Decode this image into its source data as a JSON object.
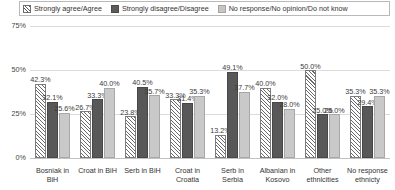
{
  "legend": {
    "position": "top",
    "items": [
      {
        "label": "Strongly agree/Agree",
        "swatch": "hatched-diagonal-swatch",
        "color": "#ffffff"
      },
      {
        "label": "Strongly disagree/Disagree",
        "swatch": "solid-dark-swatch",
        "color": "#585858"
      },
      {
        "label": "No response/No opinion/Do not know",
        "swatch": "solid-light-swatch",
        "color": "#c9c9c9"
      }
    ]
  },
  "axis": {
    "yticks": [
      "0%",
      "25%",
      "50%",
      "75%"
    ]
  },
  "chart_data": {
    "type": "bar",
    "title": "",
    "xlabel": "",
    "ylabel": "",
    "ylim": [
      0,
      75
    ],
    "grid": true,
    "legend_position": "top",
    "categories": [
      "Bosniak in BiH",
      "Croat in BiH",
      "Serb in BiH",
      "Croat in Croatia",
      "Serb in Serbia",
      "Albanian in Kosovo",
      "Other ethnicities",
      "No response ethnicty"
    ],
    "ytick_labels": [
      "0%",
      "25%",
      "50%",
      "75%"
    ],
    "ytick_values": [
      0,
      25,
      50,
      75
    ],
    "series": [
      {
        "name": "Strongly agree/Agree",
        "values": [
          42.3,
          26.7,
          23.8,
          33.3,
          13.2,
          40.0,
          50.0,
          35.3
        ],
        "labels": [
          "42.3%",
          "26.7%",
          "23.8%",
          "33.3%",
          "13.2%",
          "40.0%",
          "50.0%",
          "35.3%"
        ]
      },
      {
        "name": "Strongly disagree/Disagree",
        "values": [
          32.1,
          33.3,
          40.5,
          31.4,
          49.1,
          32.0,
          25.0,
          29.4
        ],
        "labels": [
          "32.1%",
          "33.3%",
          "40.5%",
          "31.4%",
          "49.1%",
          "32.0%",
          "25.0%",
          "29.4%"
        ]
      },
      {
        "name": "No response/No opinion/Do not know",
        "values": [
          25.6,
          40.0,
          35.7,
          35.3,
          37.7,
          28.0,
          25.0,
          35.3
        ],
        "labels": [
          "25.6%",
          "40.0%",
          "35.7%",
          "35.3%",
          "37.7%",
          "28.0%",
          "25.0%",
          "35.3%"
        ]
      }
    ]
  }
}
